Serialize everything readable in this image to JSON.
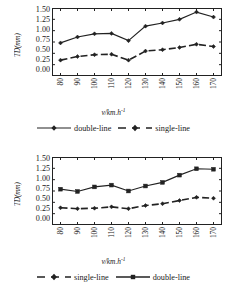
{
  "figures": [
    {
      "id": "top",
      "ylabel": "TD(mm)",
      "xlabel_main": "v/km.h",
      "xlabel_sup": "-1",
      "yticks": [
        "1.50",
        "1.25",
        "1.00",
        "0.75",
        "0.50",
        "0.25",
        "0.00"
      ],
      "xticks": [
        "80",
        "90",
        "100",
        "110",
        "120",
        "130",
        "140",
        "150",
        "160",
        "170"
      ],
      "legend": [
        {
          "label": "double-line",
          "style": "solid",
          "marker": "diamond"
        },
        {
          "label": "single-line",
          "style": "dashed",
          "marker": "diamond"
        }
      ],
      "chart_data": {
        "type": "line",
        "title": "",
        "xlabel": "v/km.h-1",
        "ylabel": "TD(mm)",
        "x": [
          80,
          90,
          100,
          110,
          120,
          130,
          140,
          150,
          160,
          170
        ],
        "xlim": [
          75,
          175
        ],
        "ylim": [
          0.0,
          1.5
        ],
        "ytick_values": [
          0.0,
          0.25,
          0.5,
          0.75,
          1.0,
          1.25,
          1.5
        ],
        "grid": false,
        "legend_position": "below-axes",
        "series": [
          {
            "name": "double-line",
            "style": "solid",
            "marker": "diamond",
            "values": [
              0.73,
              0.86,
              0.93,
              0.94,
              0.78,
              1.1,
              1.17,
              1.25,
              1.41,
              1.3
            ]
          },
          {
            "name": "single-line",
            "style": "dashed",
            "marker": "diamond",
            "values": [
              0.35,
              0.43,
              0.47,
              0.48,
              0.35,
              0.55,
              0.58,
              0.63,
              0.7,
              0.65
            ]
          }
        ]
      }
    },
    {
      "id": "bottom",
      "ylabel": "TD(mm)",
      "xlabel_main": "v/km.h",
      "xlabel_sup": "-1",
      "yticks": [
        "1.50",
        "1.25",
        "1.00",
        "0.75",
        "0.50",
        "0.25",
        "0.00"
      ],
      "xticks": [
        "80",
        "90",
        "100",
        "110",
        "120",
        "130",
        "140",
        "150",
        "160",
        "170"
      ],
      "legend": [
        {
          "label": "single-line",
          "style": "dashed",
          "marker": "diamond"
        },
        {
          "label": "double-line",
          "style": "solid",
          "marker": "square"
        }
      ],
      "chart_data": {
        "type": "line",
        "title": "",
        "xlabel": "v/km.h-1",
        "ylabel": "TD(mm)",
        "x": [
          80,
          90,
          100,
          110,
          120,
          130,
          140,
          150,
          160,
          170
        ],
        "xlim": [
          75,
          175
        ],
        "ylim": [
          0.0,
          1.5
        ],
        "ytick_values": [
          0.0,
          0.25,
          0.5,
          0.75,
          1.0,
          1.25,
          1.5
        ],
        "grid": false,
        "legend_position": "below-axes",
        "series": [
          {
            "name": "single-line",
            "style": "dashed",
            "marker": "diamond",
            "values": [
              0.38,
              0.36,
              0.37,
              0.4,
              0.36,
              0.43,
              0.47,
              0.54,
              0.61,
              0.59
            ]
          },
          {
            "name": "double-line",
            "style": "solid",
            "marker": "square",
            "values": [
              0.79,
              0.74,
              0.84,
              0.88,
              0.75,
              0.86,
              0.94,
              1.1,
              1.24,
              1.23
            ]
          }
        ]
      }
    }
  ]
}
